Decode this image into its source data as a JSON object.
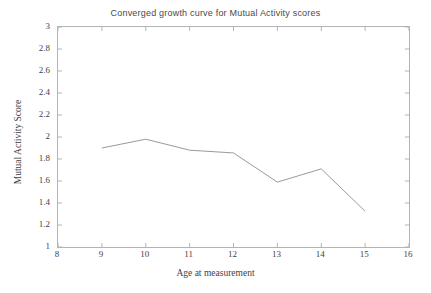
{
  "chart_data": {
    "type": "line",
    "title": "Converged growth curve for Mutual Activity scores",
    "xlabel": "Age at measurement",
    "ylabel": "Mutual Activity Score",
    "x": [
      9,
      10,
      11,
      12,
      13,
      14,
      15
    ],
    "values": [
      1.9,
      1.98,
      1.88,
      1.855,
      1.59,
      1.71,
      1.325
    ],
    "series": [
      {
        "name": "Converged growth curve",
        "values": [
          1.9,
          1.98,
          1.88,
          1.855,
          1.59,
          1.71,
          1.325
        ]
      }
    ],
    "xlim": [
      8,
      16
    ],
    "ylim": [
      1,
      3
    ],
    "xticks": [
      8,
      9,
      10,
      11,
      12,
      13,
      14,
      15,
      16
    ],
    "xtick_labels": [
      "8",
      "9",
      "10",
      "11",
      "12",
      "13",
      "14",
      "15",
      "16"
    ],
    "yticks": [
      1,
      1.2,
      1.4,
      1.6,
      1.8,
      2,
      2.2,
      2.4,
      2.6,
      2.8,
      3
    ],
    "ytick_labels": [
      "1",
      "1.2",
      "1.4",
      "1.6",
      "1.8",
      "2",
      "2.2",
      "2.4",
      "2.6",
      "2.8",
      "3"
    ],
    "grid": false,
    "legend": null,
    "line_color": "#9a9a9a",
    "frame_color": "#b3b3b3",
    "background": "#ffffff"
  }
}
